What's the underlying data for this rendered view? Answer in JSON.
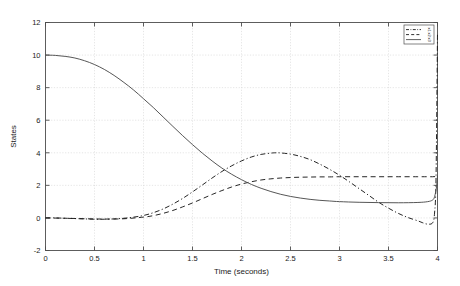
{
  "chart_data": {
    "type": "line",
    "title": "",
    "xlabel": "Time (seconds)",
    "ylabel": "States",
    "xlim": [
      0,
      4
    ],
    "ylim": [
      -2,
      12
    ],
    "xticks": [
      "0",
      "0.5",
      "1",
      "1.5",
      "2",
      "2.5",
      "3",
      "3.5",
      "4"
    ],
    "xtick_values": [
      0,
      0.5,
      1,
      1.5,
      2,
      2.5,
      3,
      3.5,
      4
    ],
    "yticks": [
      "-2",
      "0",
      "2",
      "4",
      "6",
      "8",
      "10",
      "12"
    ],
    "ytick_values": [
      -2,
      0,
      2,
      4,
      6,
      8,
      10,
      12
    ],
    "grid": true,
    "grid_color": "#d4d4d4",
    "axis_color": "#4d4d4d",
    "background": "#ffffff",
    "legend_position": "top-right",
    "legend": [
      {
        "label": "x1",
        "style": "dashdot",
        "color": "#1a1a1a"
      },
      {
        "label": "x2",
        "style": "dashed",
        "color": "#1a1a1a"
      },
      {
        "label": "x3",
        "style": "solid",
        "color": "#4d4d4d"
      }
    ],
    "series": [
      {
        "name": "x1",
        "style": "dashdot",
        "color": "#1a1a1a",
        "x": [
          0,
          0.1,
          0.2,
          0.3,
          0.4,
          0.5,
          0.6,
          0.7,
          0.8,
          0.9,
          1.0,
          1.1,
          1.2,
          1.3,
          1.4,
          1.5,
          1.6,
          1.7,
          1.8,
          1.9,
          2.0,
          2.1,
          2.2,
          2.3,
          2.35,
          2.4,
          2.5,
          2.6,
          2.7,
          2.8,
          2.9,
          3.0,
          3.1,
          3.2,
          3.3,
          3.4,
          3.5,
          3.6,
          3.7,
          3.8,
          3.85,
          3.9,
          3.95,
          3.97,
          3.985,
          4.0
        ],
        "y": [
          0.0,
          0.0,
          -0.02,
          -0.04,
          -0.06,
          -0.08,
          -0.08,
          -0.06,
          -0.02,
          0.05,
          0.15,
          0.32,
          0.55,
          0.85,
          1.2,
          1.6,
          2.02,
          2.45,
          2.85,
          3.2,
          3.5,
          3.74,
          3.9,
          3.98,
          4.0,
          3.99,
          3.92,
          3.78,
          3.58,
          3.3,
          2.98,
          2.62,
          2.22,
          1.8,
          1.38,
          0.96,
          0.6,
          0.28,
          0.02,
          -0.18,
          -0.3,
          -0.38,
          -0.3,
          0.3,
          2.5,
          11.3
        ]
      },
      {
        "name": "x2",
        "style": "dashed",
        "color": "#1a1a1a",
        "x": [
          0,
          0.2,
          0.4,
          0.6,
          0.8,
          1.0,
          1.1,
          1.2,
          1.3,
          1.4,
          1.5,
          1.6,
          1.7,
          1.8,
          1.9,
          2.0,
          2.1,
          2.2,
          2.3,
          2.4,
          2.5,
          2.6,
          2.7,
          2.8,
          2.9,
          3.0,
          3.2,
          3.4,
          3.6,
          3.8,
          3.9,
          3.95,
          4.0
        ],
        "y": [
          0.0,
          -0.02,
          -0.05,
          -0.07,
          -0.05,
          0.05,
          0.14,
          0.28,
          0.46,
          0.68,
          0.92,
          1.18,
          1.44,
          1.68,
          1.9,
          2.08,
          2.22,
          2.33,
          2.4,
          2.45,
          2.48,
          2.5,
          2.51,
          2.52,
          2.52,
          2.53,
          2.53,
          2.53,
          2.53,
          2.53,
          2.53,
          2.53,
          2.55
        ]
      },
      {
        "name": "x3",
        "style": "solid",
        "color": "#4d4d4d",
        "x": [
          0,
          0.1,
          0.2,
          0.3,
          0.4,
          0.5,
          0.6,
          0.7,
          0.8,
          0.9,
          1.0,
          1.1,
          1.2,
          1.3,
          1.4,
          1.5,
          1.6,
          1.7,
          1.8,
          1.9,
          2.0,
          2.1,
          2.2,
          2.3,
          2.4,
          2.5,
          2.6,
          2.7,
          2.8,
          2.9,
          3.0,
          3.2,
          3.4,
          3.6,
          3.8,
          3.9,
          3.95,
          3.97,
          3.99,
          4.0
        ],
        "y": [
          10.0,
          9.98,
          9.92,
          9.82,
          9.65,
          9.42,
          9.12,
          8.75,
          8.32,
          7.85,
          7.32,
          6.78,
          6.2,
          5.62,
          5.05,
          4.5,
          3.98,
          3.5,
          3.06,
          2.68,
          2.35,
          2.06,
          1.82,
          1.62,
          1.45,
          1.32,
          1.22,
          1.14,
          1.08,
          1.04,
          1.0,
          0.96,
          0.94,
          0.93,
          0.95,
          1.0,
          1.1,
          1.3,
          1.9,
          2.6
        ]
      }
    ]
  },
  "figure": {
    "axis_label_x": "Time (seconds)",
    "axis_label_y": "States"
  }
}
